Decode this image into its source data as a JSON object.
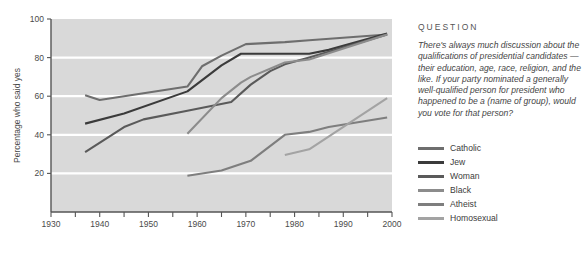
{
  "side_panel": {
    "heading": "QUESTION",
    "question_text": "There's always much discussion about the qualifications of presidential candidates — their education, age, race, religion, and the like. If your party nominated a generally well-qualified person for president who happened to be a (name of group), would you vote for that person?"
  },
  "colors": {
    "plot_background": "#d9d9d9",
    "gridline": "#ffffff",
    "axis": "#555555",
    "page_background": "#ffffff",
    "catholic": "#6e6e6e",
    "jew": "#3b3b3b",
    "woman": "#5a5a5a",
    "black": "#8c8c8c",
    "atheist": "#7e7e7e",
    "homosexual": "#a3a3a3"
  },
  "chart_data": {
    "type": "line",
    "title": "",
    "subtitle": "",
    "xlabel": "",
    "ylabel": "Percentage who said yes",
    "xlim": [
      1930,
      2000
    ],
    "ylim": [
      0,
      100
    ],
    "grid": true,
    "gridlines_y": [
      20,
      40,
      60,
      80,
      100
    ],
    "xticks_major": [
      1930,
      1940,
      1950,
      1960,
      1970,
      1980,
      1990,
      2000
    ],
    "xtick_labels": [
      "1930",
      "1940",
      "1950",
      "1960",
      "1970",
      "1980",
      "1990",
      "2000"
    ],
    "xticks_minor": [
      1935,
      1945,
      1955,
      1965,
      1975,
      1985,
      1995
    ],
    "yticks": [
      20,
      40,
      60,
      80,
      100
    ],
    "ytick_labels": [
      "20",
      "40",
      "60",
      "80",
      "100"
    ],
    "legend_position": "right",
    "series": [
      {
        "name": "Catholic",
        "color": "#6e6e6e",
        "points": [
          [
            1937,
            60.5
          ],
          [
            1940,
            58.0
          ],
          [
            1958,
            65.0
          ],
          [
            1961,
            75.5
          ],
          [
            1965,
            81.0
          ],
          [
            1970,
            87.0
          ],
          [
            1978,
            88.0
          ],
          [
            1983,
            89.0
          ],
          [
            1999,
            92.0
          ]
        ]
      },
      {
        "name": "Jew",
        "color": "#3b3b3b",
        "points": [
          [
            1937,
            45.8
          ],
          [
            1945,
            51.0
          ],
          [
            1958,
            62.5
          ],
          [
            1965,
            76.0
          ],
          [
            1969,
            82.0
          ],
          [
            1983,
            82.0
          ],
          [
            1987,
            84.0
          ],
          [
            1999,
            92.5
          ]
        ]
      },
      {
        "name": "Woman",
        "color": "#5a5a5a",
        "points": [
          [
            1937,
            31.0
          ],
          [
            1945,
            44.0
          ],
          [
            1949,
            48.0
          ],
          [
            1958,
            52.5
          ],
          [
            1967,
            57.0
          ],
          [
            1971,
            66.0
          ],
          [
            1975,
            73.0
          ],
          [
            1978,
            76.5
          ],
          [
            1983,
            80.0
          ],
          [
            1999,
            92.0
          ]
        ]
      },
      {
        "name": "Black",
        "color": "#8c8c8c",
        "points": [
          [
            1958,
            40.5
          ],
          [
            1965,
            59.0
          ],
          [
            1969,
            67.0
          ],
          [
            1971,
            70.0
          ],
          [
            1978,
            77.5
          ],
          [
            1983,
            79.0
          ],
          [
            1999,
            92.0
          ]
        ]
      },
      {
        "name": "Atheist",
        "color": "#7e7e7e",
        "points": [
          [
            1958,
            18.8
          ],
          [
            1965,
            21.5
          ],
          [
            1971,
            26.5
          ],
          [
            1978,
            40.0
          ],
          [
            1983,
            41.5
          ],
          [
            1987,
            44.0
          ],
          [
            1999,
            49.0
          ]
        ]
      },
      {
        "name": "Homosexual",
        "color": "#a3a3a3",
        "points": [
          [
            1978,
            29.5
          ],
          [
            1983,
            32.5
          ],
          [
            1999,
            59.0
          ]
        ]
      }
    ]
  },
  "legend": {
    "items": [
      {
        "label": "Catholic",
        "color": "#6e6e6e"
      },
      {
        "label": "Jew",
        "color": "#3b3b3b"
      },
      {
        "label": "Woman",
        "color": "#5a5a5a"
      },
      {
        "label": "Black",
        "color": "#8c8c8c"
      },
      {
        "label": "Atheist",
        "color": "#7e7e7e"
      },
      {
        "label": "Homosexual",
        "color": "#a3a3a3"
      }
    ]
  }
}
